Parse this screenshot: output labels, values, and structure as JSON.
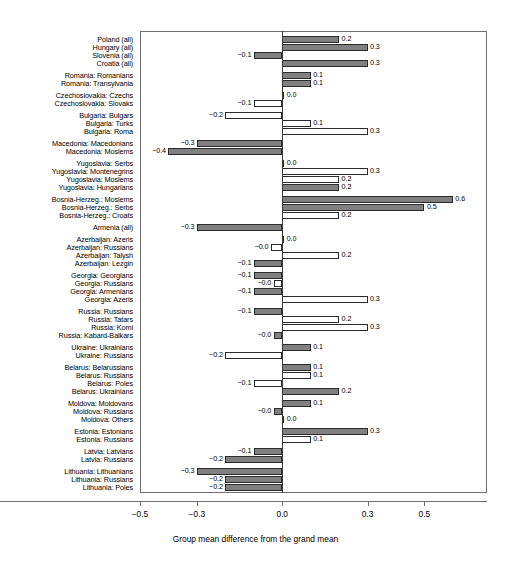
{
  "chart_data": {
    "type": "bar",
    "orientation": "horizontal",
    "title": "",
    "xlabel": "Group mean difference from the grand mean",
    "ylabel": "",
    "xlim": [
      -0.5,
      0.72
    ],
    "xticks": [
      -0.5,
      -0.3,
      0.0,
      0.3,
      0.5
    ],
    "xticklabels": [
      "-0.5",
      "-0.3",
      "0.0",
      "0.3",
      "0.5"
    ],
    "grid": false,
    "legend": null,
    "zero_reference_line": 0.0,
    "categories": [
      "Poland (all)",
      "Hungary (all)",
      "Slovenia (all)",
      "Croatia (all)",
      "Romania: Romanians",
      "Romania: Transylvania",
      "Czechoslovakia: Czechs",
      "Czechoslovakia: Slovaks",
      "Bulgaria: Bulgars",
      "Bulgaria: Turks",
      "Bulgaria: Roma",
      "Macedonia: Macedonians",
      "Macedonia: Moslems",
      "Yugoslavia: Serbs",
      "Yugoslavia: Montenegrins",
      "Yugoslavia: Moslems",
      "Yugoslavia: Hungarians",
      "Bosnia-Herzeg.: Moslems",
      "Bosnia-Herzeg.: Serbs",
      "Bosnia-Herzeg.: Croats",
      "Armenia (all)",
      "Azerbaijan: Azeris",
      "Azerbaijan: Russians",
      "Azerbaijan: Talysh",
      "Azerbaijan: Lezgin",
      "Georgia: Georgians",
      "Georgia: Russians",
      "Georgia: Armenians",
      "Georgia: Azeris",
      "Russia: Russians",
      "Russia: Tatars",
      "Russia: Komi",
      "Russia: Kabard-Balkars",
      "Ukraine: Ukrainians",
      "Ukraine: Russians",
      "Belarus: Belarussians",
      "Belarus: Russians",
      "Belarus: Poles",
      "Belarus: Ukrainians",
      "Moldova: Moldovans",
      "Moldova: Russians",
      "Moldova: Others",
      "Estonia: Estonians",
      "Estonia: Russians",
      "Latvia: Latvians",
      "Latvia: Russians",
      "Lithuania: Lithuanians",
      "Lithuania: Russians",
      "Lithuania: Poles"
    ],
    "values": [
      0.2,
      0.3,
      -0.1,
      0.3,
      0.1,
      0.1,
      0.0,
      -0.1,
      -0.2,
      0.1,
      0.3,
      -0.3,
      -0.4,
      0.0,
      0.3,
      0.2,
      0.2,
      0.6,
      0.5,
      0.2,
      -0.3,
      0.0,
      -0.04,
      0.2,
      -0.1,
      -0.1,
      -0.03,
      -0.1,
      0.3,
      -0.1,
      0.2,
      0.3,
      -0.03,
      0.1,
      -0.2,
      0.1,
      0.1,
      -0.1,
      0.2,
      0.1,
      -0.03,
      0.0,
      0.3,
      0.1,
      -0.1,
      -0.2,
      -0.3,
      -0.2,
      -0.2
    ],
    "value_labels": [
      "0.2",
      "0.3",
      "-0.1",
      "0.3",
      "0.1",
      "0.1",
      "0.0",
      "-0.1",
      "-0.2",
      "0.1",
      "0.3",
      "-0.3",
      "-0.4",
      "0.0",
      "0.3",
      "0.2",
      "0.2",
      "0.6",
      "0.5",
      "0.2",
      "-0.3",
      "0.0",
      "-0.0",
      "0.2",
      "-0.1",
      "-0.1",
      "-0.0",
      "-0.1",
      "0.3",
      "-0.1",
      "0.2",
      "0.3",
      "-0.0",
      "0.1",
      "-0.2",
      "0.1",
      "0.1",
      "-0.1",
      "0.2",
      "0.1",
      "-0.0",
      "0.0",
      "0.3",
      "0.1",
      "-0.1",
      "-0.2",
      "-0.3",
      "-0.2",
      "-0.2"
    ],
    "bar_styles": [
      "filled",
      "filled",
      "filled",
      "filled",
      "filled",
      "filled",
      "filled",
      "hollow",
      "hollow",
      "hollow",
      "hollow",
      "filled",
      "filled",
      "filled",
      "hollow",
      "hollow",
      "filled",
      "filled",
      "filled",
      "hollow",
      "filled",
      "filled",
      "hollow",
      "hollow",
      "filled",
      "filled",
      "hollow",
      "filled",
      "hollow",
      "filled",
      "hollow",
      "hollow",
      "filled",
      "filled",
      "hollow",
      "filled",
      "hollow",
      "hollow",
      "filled",
      "filled",
      "filled",
      "filled",
      "filled",
      "hollow",
      "filled",
      "filled",
      "filled",
      "filled",
      "filled"
    ],
    "group_breaks_after": [
      3,
      5,
      7,
      10,
      12,
      16,
      19,
      20,
      24,
      28,
      32,
      34,
      38,
      41,
      43,
      45
    ]
  }
}
